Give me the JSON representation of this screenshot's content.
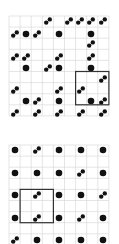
{
  "colors": {
    "background": "#ffffff",
    "grid": "#d4d4d4",
    "dot": "#111111",
    "box": "#333333"
  },
  "puzzles": [
    {
      "name": "puzzle-1",
      "origin": [
        9,
        16
      ],
      "cell": 11.1,
      "cols": 9,
      "rows": 9,
      "highlight": {
        "col": 6,
        "row": 5,
        "w": 3,
        "h": 3
      },
      "pieces": [
        {
          "x": 48,
          "y": 21,
          "t": "pair"
        },
        {
          "x": 69,
          "y": 21,
          "t": "pair"
        },
        {
          "x": 80,
          "y": 21,
          "t": "pair"
        },
        {
          "x": 91,
          "y": 21,
          "t": "pair"
        },
        {
          "x": 103,
          "y": 21,
          "t": "pair"
        },
        {
          "x": 15,
          "y": 34,
          "t": "pair"
        },
        {
          "x": 26,
          "y": 34,
          "t": "dot"
        },
        {
          "x": 37,
          "y": 34,
          "t": "pair"
        },
        {
          "x": 59,
          "y": 34,
          "t": "dot"
        },
        {
          "x": 91,
          "y": 34,
          "t": "dot"
        },
        {
          "x": 91,
          "y": 44,
          "t": "pair"
        },
        {
          "x": 15,
          "y": 57,
          "t": "pair"
        },
        {
          "x": 26,
          "y": 57,
          "t": "pair"
        },
        {
          "x": 59,
          "y": 57,
          "t": "pair"
        },
        {
          "x": 91,
          "y": 57,
          "t": "pair"
        },
        {
          "x": 26,
          "y": 68,
          "t": "dot"
        },
        {
          "x": 48,
          "y": 68,
          "t": "pair"
        },
        {
          "x": 59,
          "y": 68,
          "t": "dot"
        },
        {
          "x": 91,
          "y": 68,
          "t": "dot"
        },
        {
          "x": 103,
          "y": 79,
          "t": "pair"
        },
        {
          "x": 15,
          "y": 90,
          "t": "pair"
        },
        {
          "x": 59,
          "y": 90,
          "t": "pair"
        },
        {
          "x": 81,
          "y": 90,
          "t": "pair"
        },
        {
          "x": 26,
          "y": 101,
          "t": "dot"
        },
        {
          "x": 37,
          "y": 101,
          "t": "pair"
        },
        {
          "x": 59,
          "y": 101,
          "t": "dot"
        },
        {
          "x": 91,
          "y": 101,
          "t": "dot"
        },
        {
          "x": 103,
          "y": 101,
          "t": "pair"
        },
        {
          "x": 15,
          "y": 113,
          "t": "pair"
        },
        {
          "x": 37,
          "y": 113,
          "t": "pair"
        },
        {
          "x": 59,
          "y": 113,
          "t": "pair"
        },
        {
          "x": 81,
          "y": 113,
          "t": "pair"
        },
        {
          "x": 103,
          "y": 113,
          "t": "pair"
        }
      ]
    },
    {
      "name": "puzzle-2",
      "origin": [
        9,
        145
      ],
      "cell": 11.1,
      "cols": 9,
      "rows": 9,
      "highlight": {
        "col": 1,
        "row": 4,
        "w": 3,
        "h": 3
      },
      "pieces": [
        {
          "x": 15,
          "y": 150,
          "t": "dot"
        },
        {
          "x": 37,
          "y": 150,
          "t": "pair"
        },
        {
          "x": 59,
          "y": 150,
          "t": "dot"
        },
        {
          "x": 81,
          "y": 150,
          "t": "dot"
        },
        {
          "x": 103,
          "y": 150,
          "t": "dot"
        },
        {
          "x": 15,
          "y": 173,
          "t": "dot"
        },
        {
          "x": 37,
          "y": 173,
          "t": "dot"
        },
        {
          "x": 59,
          "y": 173,
          "t": "dot"
        },
        {
          "x": 81,
          "y": 173,
          "t": "pair"
        },
        {
          "x": 103,
          "y": 173,
          "t": "dot"
        },
        {
          "x": 15,
          "y": 195,
          "t": "dot"
        },
        {
          "x": 37,
          "y": 195,
          "t": "pair"
        },
        {
          "x": 59,
          "y": 195,
          "t": "dot"
        },
        {
          "x": 81,
          "y": 195,
          "t": "dot"
        },
        {
          "x": 103,
          "y": 195,
          "t": "pair"
        },
        {
          "x": 15,
          "y": 218,
          "t": "dot"
        },
        {
          "x": 37,
          "y": 218,
          "t": "pair"
        },
        {
          "x": 59,
          "y": 218,
          "t": "dot"
        },
        {
          "x": 81,
          "y": 218,
          "t": "pair"
        },
        {
          "x": 103,
          "y": 218,
          "t": "dot"
        },
        {
          "x": 15,
          "y": 240,
          "t": "pair"
        },
        {
          "x": 37,
          "y": 240,
          "t": "dot"
        },
        {
          "x": 59,
          "y": 240,
          "t": "dot"
        },
        {
          "x": 81,
          "y": 240,
          "t": "dot"
        },
        {
          "x": 103,
          "y": 240,
          "t": "dot"
        }
      ]
    }
  ]
}
